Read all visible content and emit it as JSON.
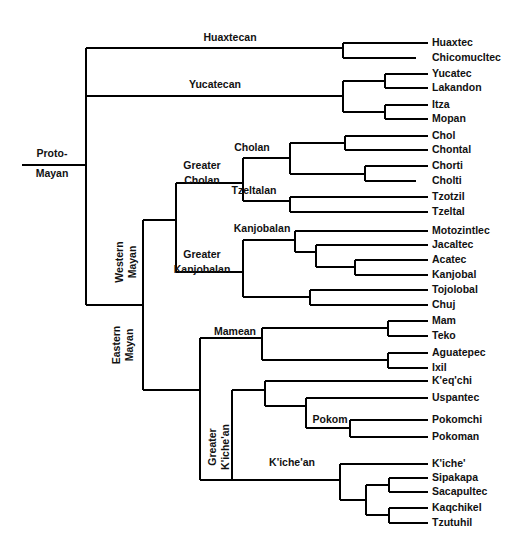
{
  "figure": {
    "root_label_line1": "Proto-",
    "root_label_line2": "Mayan",
    "line_color": "#000000",
    "text_color": "#111111",
    "background_color": "#ffffff"
  },
  "chart_data": {
    "type": "diagram",
    "subtype": "cladogram",
    "root": "Proto-Mayan",
    "leaf_count": 27,
    "internal_label_count": 13,
    "leaves": [
      {
        "name": "Huaxtec",
        "x_tip": 428,
        "y": 43,
        "label_x": 432
      },
      {
        "name": "Chicomucltec",
        "x_tip": 416,
        "y": 58,
        "label_x": 432
      },
      {
        "name": "Yucatec",
        "x_tip": 428,
        "y": 74,
        "label_x": 432
      },
      {
        "name": "Lakandon",
        "x_tip": 428,
        "y": 88,
        "label_x": 432
      },
      {
        "name": "Itza",
        "x_tip": 428,
        "y": 105,
        "label_x": 432
      },
      {
        "name": "Mopan",
        "x_tip": 428,
        "y": 119,
        "label_x": 432
      },
      {
        "name": "Chol",
        "x_tip": 428,
        "y": 136,
        "label_x": 432
      },
      {
        "name": "Chontal",
        "x_tip": 428,
        "y": 150,
        "label_x": 432
      },
      {
        "name": "Chorti",
        "x_tip": 428,
        "y": 166,
        "label_x": 432
      },
      {
        "name": "Cholti",
        "x_tip": 416,
        "y": 181,
        "label_x": 432
      },
      {
        "name": "Tzotzil",
        "x_tip": 428,
        "y": 197,
        "label_x": 432
      },
      {
        "name": "Tzeltal",
        "x_tip": 428,
        "y": 212,
        "label_x": 432
      },
      {
        "name": "Motozintlec",
        "x_tip": 428,
        "y": 231,
        "label_x": 432
      },
      {
        "name": "Jacaltec",
        "x_tip": 428,
        "y": 245,
        "label_x": 432
      },
      {
        "name": "Acatec",
        "x_tip": 428,
        "y": 260,
        "label_x": 432
      },
      {
        "name": "Kanjobal",
        "x_tip": 428,
        "y": 275,
        "label_x": 432
      },
      {
        "name": "Tojolobal",
        "x_tip": 428,
        "y": 290,
        "label_x": 432
      },
      {
        "name": "Chuj",
        "x_tip": 428,
        "y": 305,
        "label_x": 432
      },
      {
        "name": "Mam",
        "x_tip": 428,
        "y": 321,
        "label_x": 432
      },
      {
        "name": "Teko",
        "x_tip": 428,
        "y": 336,
        "label_x": 432
      },
      {
        "name": "Aguatepec",
        "x_tip": 428,
        "y": 353,
        "label_x": 432
      },
      {
        "name": "Ixil",
        "x_tip": 428,
        "y": 368,
        "label_x": 432
      },
      {
        "name": "K'eq'chi",
        "x_tip": 428,
        "y": 381,
        "label_x": 432
      },
      {
        "name": "Uspantec",
        "x_tip": 428,
        "y": 398,
        "label_x": 432
      },
      {
        "name": "Pokomchi",
        "x_tip": 428,
        "y": 420,
        "label_x": 432
      },
      {
        "name": "Pokoman",
        "x_tip": 428,
        "y": 437,
        "label_x": 432
      },
      {
        "name": "K'iche'",
        "x_tip": 428,
        "y": 464,
        "label_x": 432
      },
      {
        "name": "Sipakapa",
        "x_tip": 428,
        "y": 478,
        "label_x": 432
      },
      {
        "name": "Sacapultec",
        "x_tip": 428,
        "y": 492,
        "label_x": 432
      },
      {
        "name": "Kaqchikel",
        "x_tip": 428,
        "y": 508,
        "label_x": 432
      },
      {
        "name": "Tzutuhil",
        "x_tip": 428,
        "y": 523,
        "label_x": 432
      }
    ],
    "internal_labels": [
      {
        "name": "Huaxtecan",
        "x": 230,
        "y": 41,
        "rotated": false,
        "lines": [
          "Huaxtecan"
        ]
      },
      {
        "name": "Yucatecan",
        "x": 215,
        "y": 88,
        "rotated": false,
        "lines": [
          "Yucatecan"
        ]
      },
      {
        "name": "Cholan",
        "x": 252,
        "y": 151,
        "rotated": false,
        "lines": [
          "Cholan"
        ]
      },
      {
        "name": "Greater Cholan",
        "x": 202,
        "y": 176,
        "rotated": false,
        "lines": [
          "Greater",
          "Cholan"
        ]
      },
      {
        "name": "Tzeltalan",
        "x": 254,
        "y": 194,
        "rotated": false,
        "lines": [
          "Tzeltalan"
        ]
      },
      {
        "name": "Kanjobalan",
        "x": 262,
        "y": 232,
        "rotated": false,
        "lines": [
          "Kanjobalan"
        ]
      },
      {
        "name": "Greater Kanjobalan",
        "x": 202,
        "y": 265,
        "rotated": false,
        "lines": [
          "Greater",
          "Kanjobalan"
        ]
      },
      {
        "name": "Mameanic",
        "x": 235,
        "y": 335,
        "rotated": false,
        "lines": [
          "Mamean"
        ]
      },
      {
        "name": "Pokom",
        "x": 330,
        "y": 423,
        "rotated": false,
        "lines": [
          "Pokom"
        ]
      },
      {
        "name": "K'iche'an",
        "x": 292,
        "y": 466,
        "rotated": false,
        "lines": [
          "K'iche'an"
        ]
      },
      {
        "name": "Western Mayan",
        "x": 129,
        "y": 262,
        "rotated": true,
        "lines": [
          "Western",
          "Mayan"
        ]
      },
      {
        "name": "Eastern Mayan",
        "x": 126,
        "y": 345,
        "rotated": true,
        "lines": [
          "Eastern",
          "Mayan"
        ]
      },
      {
        "name": "Greater K'iche'an",
        "x": 222,
        "y": 447,
        "rotated": true,
        "lines": [
          "Greater",
          "K'iche'an"
        ]
      }
    ],
    "topology": "(Huaxtecan(Huaxtec,Chicomucltec),Yucatecan((Yucatec,Lakandon),(Itza,Mopan)),WesternMayan(GreaterCholan(Cholan((Chol,Chontal),(Chorti,Cholti)),Tzeltalan(Tzotzil,Tzeltal)),GreaterKanjobalan(Kanjobalan(Motozintlec,(Jacaltec,(Acatec,Kanjobal))),(Tojolobal,Chuj))),EasternMayan(Mamean((Mam,Teko),(Aguatepec,Ixil)),GreaterKiche'an(Kiche'an_upper(K'eq'chi,(Uspantec,Pokom(Pokomchi,Pokoman))),Kiche'an_lower(K'iche',((Sipakapa,Sacapultec),(Kaqchikel,Tzutuhil))))))",
    "branch_segments": [
      {
        "id": "root-stem",
        "x1": 22,
        "y1": 165,
        "x2": 86,
        "y2": 165
      },
      {
        "id": "root-vertical",
        "x1": 86,
        "y1": 48,
        "x2": 86,
        "y2": 305
      },
      {
        "id": "huaxtecan-stem",
        "x1": 86,
        "y1": 48,
        "x2": 343,
        "y2": 48
      },
      {
        "id": "huaxtecan-vertical",
        "x1": 343,
        "y1": 43,
        "x2": 343,
        "y2": 58
      },
      {
        "id": "huaxtec-tip",
        "x1": 343,
        "y1": 43,
        "x2": 428,
        "y2": 43
      },
      {
        "id": "chicomucltec-tip",
        "x1": 343,
        "y1": 58,
        "x2": 416,
        "y2": 58
      },
      {
        "id": "yucatecan-stem",
        "x1": 86,
        "y1": 96,
        "x2": 343,
        "y2": 96
      },
      {
        "id": "yucatecan-vertical",
        "x1": 343,
        "y1": 81,
        "x2": 343,
        "y2": 112
      },
      {
        "id": "yuc-lak-stem",
        "x1": 343,
        "y1": 81,
        "x2": 385,
        "y2": 81
      },
      {
        "id": "yuc-lak-vertical",
        "x1": 385,
        "y1": 74,
        "x2": 385,
        "y2": 88
      },
      {
        "id": "yucatec-tip",
        "x1": 385,
        "y1": 74,
        "x2": 428,
        "y2": 74
      },
      {
        "id": "lakandon-tip",
        "x1": 385,
        "y1": 88,
        "x2": 428,
        "y2": 88
      },
      {
        "id": "itz-mop-stem",
        "x1": 343,
        "y1": 112,
        "x2": 385,
        "y2": 112
      },
      {
        "id": "itz-mop-vertical",
        "x1": 385,
        "y1": 105,
        "x2": 385,
        "y2": 119
      },
      {
        "id": "itza-tip",
        "x1": 385,
        "y1": 105,
        "x2": 428,
        "y2": 105
      },
      {
        "id": "mopan-tip",
        "x1": 385,
        "y1": 119,
        "x2": 428,
        "y2": 119
      },
      {
        "id": "western-stem",
        "x1": 86,
        "y1": 305,
        "x2": 143,
        "y2": 305
      },
      {
        "id": "western-vertical",
        "x1": 143,
        "y1": 220,
        "x2": 143,
        "y2": 390
      },
      {
        "id": "wm-inner-stem",
        "x1": 143,
        "y1": 220,
        "x2": 176,
        "y2": 220
      },
      {
        "id": "wm-inner-vertical",
        "x1": 176,
        "y1": 183,
        "x2": 176,
        "y2": 272
      },
      {
        "id": "greater-cholan-stem",
        "x1": 176,
        "y1": 183,
        "x2": 243,
        "y2": 183
      },
      {
        "id": "gc-vertical",
        "x1": 243,
        "y1": 158,
        "x2": 243,
        "y2": 201
      },
      {
        "id": "cholan-stem",
        "x1": 243,
        "y1": 158,
        "x2": 290,
        "y2": 158
      },
      {
        "id": "cholan-vertical",
        "x1": 290,
        "y1": 143,
        "x2": 290,
        "y2": 174
      },
      {
        "id": "chol-chon-stem",
        "x1": 290,
        "y1": 143,
        "x2": 345,
        "y2": 143
      },
      {
        "id": "chol-chon-vertical",
        "x1": 345,
        "y1": 136,
        "x2": 345,
        "y2": 150
      },
      {
        "id": "chol-tip",
        "x1": 345,
        "y1": 136,
        "x2": 428,
        "y2": 136
      },
      {
        "id": "chontal-tip",
        "x1": 345,
        "y1": 150,
        "x2": 428,
        "y2": 150
      },
      {
        "id": "chor-chol-stem",
        "x1": 290,
        "y1": 174,
        "x2": 365,
        "y2": 174
      },
      {
        "id": "chor-chol-vertical",
        "x1": 365,
        "y1": 166,
        "x2": 365,
        "y2": 181
      },
      {
        "id": "chorti-tip",
        "x1": 365,
        "y1": 166,
        "x2": 428,
        "y2": 166
      },
      {
        "id": "cholti-tip",
        "x1": 365,
        "y1": 181,
        "x2": 416,
        "y2": 181
      },
      {
        "id": "tzeltalan-stem",
        "x1": 243,
        "y1": 201,
        "x2": 290,
        "y2": 201
      },
      {
        "id": "tzeltalan-vertical",
        "x1": 290,
        "y1": 197,
        "x2": 290,
        "y2": 212
      },
      {
        "id": "tzotzil-tip",
        "x1": 290,
        "y1": 197,
        "x2": 428,
        "y2": 197
      },
      {
        "id": "tzeltal-tip",
        "x1": 290,
        "y1": 212,
        "x2": 428,
        "y2": 212
      },
      {
        "id": "greater-kanj-stem",
        "x1": 176,
        "y1": 272,
        "x2": 243,
        "y2": 272
      },
      {
        "id": "gk-vertical",
        "x1": 243,
        "y1": 240,
        "x2": 243,
        "y2": 297
      },
      {
        "id": "kanjobalan-stem",
        "x1": 243,
        "y1": 240,
        "x2": 295,
        "y2": 240
      },
      {
        "id": "kanjobalan-vertical",
        "x1": 295,
        "y1": 231,
        "x2": 295,
        "y2": 252
      },
      {
        "id": "motozintlec-tip",
        "x1": 295,
        "y1": 231,
        "x2": 428,
        "y2": 231
      },
      {
        "id": "jac-group-stem",
        "x1": 295,
        "y1": 252,
        "x2": 316,
        "y2": 252
      },
      {
        "id": "jac-group-vertical",
        "x1": 316,
        "y1": 245,
        "x2": 316,
        "y2": 267
      },
      {
        "id": "jacaltec-tip",
        "x1": 316,
        "y1": 245,
        "x2": 428,
        "y2": 245
      },
      {
        "id": "aca-kan-stem",
        "x1": 316,
        "y1": 267,
        "x2": 355,
        "y2": 267
      },
      {
        "id": "aca-kan-vertical",
        "x1": 355,
        "y1": 260,
        "x2": 355,
        "y2": 275
      },
      {
        "id": "acatec-tip",
        "x1": 355,
        "y1": 260,
        "x2": 428,
        "y2": 260
      },
      {
        "id": "kanjobal-tip",
        "x1": 355,
        "y1": 275,
        "x2": 428,
        "y2": 275
      },
      {
        "id": "toj-chuj-stem",
        "x1": 243,
        "y1": 297,
        "x2": 310,
        "y2": 297
      },
      {
        "id": "toj-chuj-vertical",
        "x1": 310,
        "y1": 290,
        "x2": 310,
        "y2": 305
      },
      {
        "id": "tojolobal-tip",
        "x1": 310,
        "y1": 290,
        "x2": 428,
        "y2": 290
      },
      {
        "id": "chuj-tip",
        "x1": 310,
        "y1": 305,
        "x2": 428,
        "y2": 305
      },
      {
        "id": "eastern-stem",
        "x1": 143,
        "y1": 390,
        "x2": 143,
        "y2": 390
      },
      {
        "id": "eastern-connect",
        "x1": 143,
        "y1": 390,
        "x2": 200,
        "y2": 390
      },
      {
        "id": "eastern-vertical",
        "x1": 200,
        "y1": 338,
        "x2": 200,
        "y2": 480
      },
      {
        "id": "mamean-stem",
        "x1": 200,
        "y1": 338,
        "x2": 262,
        "y2": 338
      },
      {
        "id": "mamean-vertical",
        "x1": 262,
        "y1": 328,
        "x2": 262,
        "y2": 360
      },
      {
        "id": "mam-teko-stem",
        "x1": 262,
        "y1": 328,
        "x2": 388,
        "y2": 328
      },
      {
        "id": "mam-teko-vertical",
        "x1": 388,
        "y1": 321,
        "x2": 388,
        "y2": 336
      },
      {
        "id": "mam-tip",
        "x1": 388,
        "y1": 321,
        "x2": 428,
        "y2": 321
      },
      {
        "id": "teko-tip",
        "x1": 388,
        "y1": 336,
        "x2": 428,
        "y2": 336
      },
      {
        "id": "agu-ixil-stem",
        "x1": 262,
        "y1": 360,
        "x2": 388,
        "y2": 360
      },
      {
        "id": "agu-ixil-vertical",
        "x1": 388,
        "y1": 353,
        "x2": 388,
        "y2": 368
      },
      {
        "id": "aguatepec-tip",
        "x1": 388,
        "y1": 353,
        "x2": 428,
        "y2": 353
      },
      {
        "id": "ixil-tip",
        "x1": 388,
        "y1": 368,
        "x2": 428,
        "y2": 368
      },
      {
        "id": "greater-kiche-stem",
        "x1": 200,
        "y1": 480,
        "x2": 232,
        "y2": 480
      },
      {
        "id": "gki-vertical",
        "x1": 232,
        "y1": 390,
        "x2": 232,
        "y2": 480
      },
      {
        "id": "kichean-up-stem",
        "x1": 232,
        "y1": 390,
        "x2": 265,
        "y2": 390
      },
      {
        "id": "kichean-up-vertical",
        "x1": 265,
        "y1": 381,
        "x2": 265,
        "y2": 406
      },
      {
        "id": "keqchi-tip",
        "x1": 265,
        "y1": 381,
        "x2": 428,
        "y2": 381
      },
      {
        "id": "usp-pok-stem",
        "x1": 265,
        "y1": 406,
        "x2": 306,
        "y2": 406
      },
      {
        "id": "usp-pok-vertical",
        "x1": 306,
        "y1": 398,
        "x2": 306,
        "y2": 428
      },
      {
        "id": "uspantec-tip",
        "x1": 306,
        "y1": 398,
        "x2": 428,
        "y2": 398
      },
      {
        "id": "pokom-stem",
        "x1": 306,
        "y1": 428,
        "x2": 350,
        "y2": 428
      },
      {
        "id": "pokom-vertical",
        "x1": 350,
        "y1": 420,
        "x2": 350,
        "y2": 437
      },
      {
        "id": "pokomchi-tip",
        "x1": 350,
        "y1": 420,
        "x2": 428,
        "y2": 420
      },
      {
        "id": "pokoman-tip",
        "x1": 350,
        "y1": 437,
        "x2": 428,
        "y2": 437
      },
      {
        "id": "kichean-low-stem",
        "x1": 232,
        "y1": 480,
        "x2": 340,
        "y2": 480
      },
      {
        "id": "kichean-low-vert",
        "x1": 340,
        "y1": 464,
        "x2": 340,
        "y2": 500
      },
      {
        "id": "kiche-tip",
        "x1": 340,
        "y1": 464,
        "x2": 428,
        "y2": 464
      },
      {
        "id": "kiche-sub-stem",
        "x1": 340,
        "y1": 500,
        "x2": 366,
        "y2": 500
      },
      {
        "id": "kiche-sub-vertical",
        "x1": 366,
        "y1": 485,
        "x2": 366,
        "y2": 515
      },
      {
        "id": "sip-sac-stem",
        "x1": 366,
        "y1": 485,
        "x2": 389,
        "y2": 485
      },
      {
        "id": "sip-sac-vertical",
        "x1": 389,
        "y1": 478,
        "x2": 389,
        "y2": 492
      },
      {
        "id": "sipakapa-tip",
        "x1": 389,
        "y1": 478,
        "x2": 428,
        "y2": 478
      },
      {
        "id": "sacapultec-tip",
        "x1": 389,
        "y1": 492,
        "x2": 428,
        "y2": 492
      },
      {
        "id": "kaq-tzu-stem",
        "x1": 366,
        "y1": 515,
        "x2": 389,
        "y2": 515
      },
      {
        "id": "kaq-tzu-vertical",
        "x1": 389,
        "y1": 508,
        "x2": 389,
        "y2": 523
      },
      {
        "id": "kaqchikel-tip",
        "x1": 389,
        "y1": 508,
        "x2": 428,
        "y2": 508
      },
      {
        "id": "tzutuhil-tip",
        "x1": 389,
        "y1": 523,
        "x2": 428,
        "y2": 523
      }
    ],
    "root_node": {
      "label_x": 52,
      "line1_y": 157,
      "line2_y": 177
    }
  }
}
